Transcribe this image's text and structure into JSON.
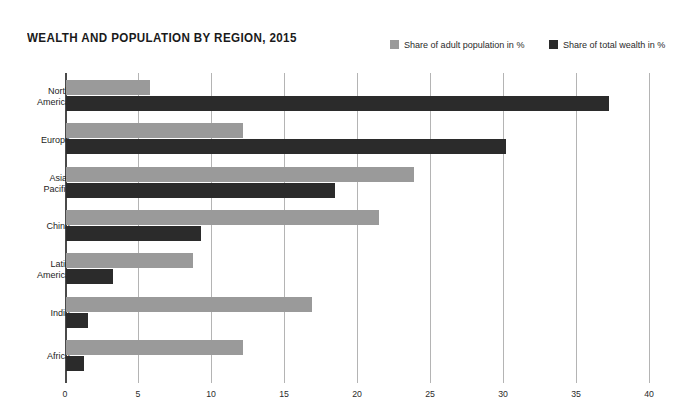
{
  "header": {
    "title": "WEALTH AND POPULATION BY REGION, 2015"
  },
  "legend": {
    "items": [
      {
        "label": "Share of adult population in %",
        "color": "#9a9a9a",
        "key": "population"
      },
      {
        "label": "Share of total wealth in %",
        "color": "#2b2b2b",
        "key": "wealth"
      }
    ]
  },
  "chart_data": {
    "type": "bar",
    "orientation": "horizontal",
    "title": "WEALTH AND POPULATION BY REGION, 2015",
    "xlabel": "",
    "ylabel": "",
    "xlim": [
      0,
      40
    ],
    "xticks": [
      0,
      5,
      10,
      15,
      20,
      25,
      30,
      35,
      40
    ],
    "grid": true,
    "legend_position": "top-right",
    "categories": [
      "North America",
      "Europe",
      "Asia-Pacific",
      "China",
      "Latin America",
      "India",
      "Africa"
    ],
    "category_lines": [
      [
        "North",
        "America"
      ],
      [
        "Europe"
      ],
      [
        "Asia-",
        "Pacific"
      ],
      [
        "China"
      ],
      [
        "Latin",
        "America"
      ],
      [
        "India"
      ],
      [
        "Africa"
      ]
    ],
    "series": [
      {
        "name": "Share of adult population in %",
        "color": "#9a9a9a",
        "values": [
          5.7,
          12.1,
          23.8,
          21.4,
          8.7,
          16.8,
          12.1
        ]
      },
      {
        "name": "Share of total wealth in %",
        "color": "#2b2b2b",
        "values": [
          37.2,
          30.1,
          18.4,
          9.2,
          3.2,
          1.5,
          1.2
        ]
      }
    ]
  },
  "axis": {
    "tick_labels": [
      "0",
      "5",
      "10",
      "15",
      "20",
      "25",
      "30",
      "35",
      "40"
    ]
  }
}
